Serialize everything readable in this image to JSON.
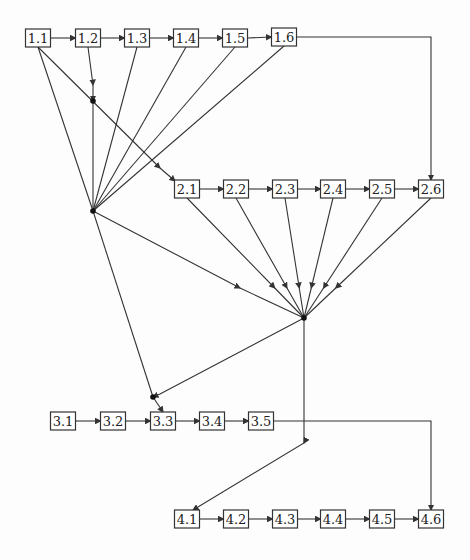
{
  "diagram": {
    "nodes": [
      {
        "id": "1.1",
        "label": "1.1",
        "x": 38,
        "y": 38
      },
      {
        "id": "1.2",
        "label": "1.2",
        "x": 88,
        "y": 38
      },
      {
        "id": "1.3",
        "label": "1.3",
        "x": 137,
        "y": 38
      },
      {
        "id": "1.4",
        "label": "1.4",
        "x": 186,
        "y": 38
      },
      {
        "id": "1.5",
        "label": "1.5",
        "x": 235,
        "y": 38
      },
      {
        "id": "1.6",
        "label": "1.6",
        "x": 284,
        "y": 37
      },
      {
        "id": "2.1",
        "label": "2.1",
        "x": 187,
        "y": 189
      },
      {
        "id": "2.2",
        "label": "2.2",
        "x": 236,
        "y": 189
      },
      {
        "id": "2.3",
        "label": "2.3",
        "x": 285,
        "y": 189
      },
      {
        "id": "2.4",
        "label": "2.4",
        "x": 333,
        "y": 189
      },
      {
        "id": "2.5",
        "label": "2.5",
        "x": 382,
        "y": 189
      },
      {
        "id": "2.6",
        "label": "2.6",
        "x": 431,
        "y": 189
      },
      {
        "id": "3.1",
        "label": "3.1",
        "x": 63,
        "y": 421
      },
      {
        "id": "3.2",
        "label": "3.2",
        "x": 113,
        "y": 421
      },
      {
        "id": "3.3",
        "label": "3.3",
        "x": 163,
        "y": 421
      },
      {
        "id": "3.4",
        "label": "3.4",
        "x": 212,
        "y": 421
      },
      {
        "id": "3.5",
        "label": "3.5",
        "x": 261,
        "y": 421
      },
      {
        "id": "4.1",
        "label": "4.1",
        "x": 187,
        "y": 519
      },
      {
        "id": "4.2",
        "label": "4.2",
        "x": 236,
        "y": 519
      },
      {
        "id": "4.3",
        "label": "4.3",
        "x": 285,
        "y": 519
      },
      {
        "id": "4.4",
        "label": "4.4",
        "x": 333,
        "y": 519
      },
      {
        "id": "4.5",
        "label": "4.5",
        "x": 382,
        "y": 519
      },
      {
        "id": "4.6",
        "label": "4.6",
        "x": 431,
        "y": 519
      }
    ],
    "hubs": [
      {
        "id": "h0",
        "x": 93,
        "y": 101
      },
      {
        "id": "h1",
        "x": 93,
        "y": 211
      },
      {
        "id": "h2",
        "x": 304,
        "y": 318
      },
      {
        "id": "h3",
        "x": 153,
        "y": 397
      }
    ]
  }
}
